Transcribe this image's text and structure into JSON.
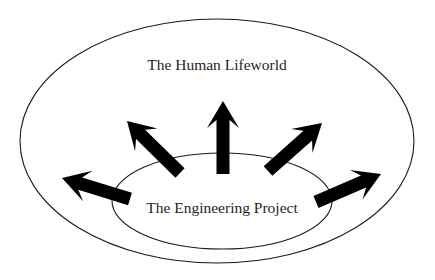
{
  "figure": {
    "type": "concentric-ellipse-radiating-arrows-diagram",
    "background_color": "#ffffff",
    "outline_color": "#1a1a1a",
    "arrow_color": "#000000",
    "text_color": "#231f20"
  },
  "outer_region": {
    "name": "human-lifeworld",
    "label": "The Human Lifeworld",
    "shape": "ellipse",
    "cx": 217,
    "cy": 141,
    "rx": 197,
    "ry": 122,
    "label_x": 217,
    "label_y": 66
  },
  "inner_region": {
    "name": "engineering-project",
    "label": "The Engineering Project",
    "shape": "ellipse",
    "cx": 222,
    "cy": 201,
    "rx": 110,
    "ry": 48,
    "label_x": 222,
    "label_y": 209
  },
  "arrows": [
    {
      "name": "arrow-left",
      "direction": "left",
      "angle_deg": 196,
      "tail_x": 130,
      "tail_y": 199,
      "tip_x": 62,
      "tip_y": 178
    },
    {
      "name": "arrow-upper-left",
      "direction": "up-left",
      "angle_deg": 137,
      "tail_x": 180,
      "tail_y": 173,
      "tip_x": 127,
      "tip_y": 121
    },
    {
      "name": "arrow-up",
      "direction": "up",
      "angle_deg": 90,
      "tail_x": 223,
      "tail_y": 174,
      "tip_x": 223,
      "tip_y": 101
    },
    {
      "name": "arrow-upper-right",
      "direction": "up-right",
      "angle_deg": 43,
      "tail_x": 268,
      "tail_y": 171,
      "tip_x": 322,
      "tip_y": 123
    },
    {
      "name": "arrow-right",
      "direction": "right",
      "angle_deg": 338,
      "tail_x": 316,
      "tail_y": 202,
      "tip_x": 381,
      "tip_y": 174
    }
  ],
  "arrow_style": {
    "shaft_half_width": 6.5,
    "head_length": 27,
    "head_half_width": 16,
    "notch_depth": 8
  }
}
